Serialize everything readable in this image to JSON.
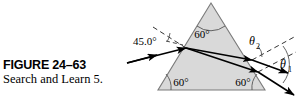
{
  "figure": {
    "number_label": "FIGURE 24–63",
    "caption": "Search and Learn 5.",
    "colors": {
      "prism_fill": "#d9d9d9",
      "prism_stroke": "#6e6e6e",
      "ray_stroke": "#000000",
      "normal_dash": "#333333",
      "arc_stroke": "#555555",
      "background": "#ffffff"
    }
  },
  "diagram": {
    "type": "optics-prism-dispersion",
    "prism": {
      "shape": "equilateral-triangle",
      "apex_angle_label": "60°",
      "bottom_left_angle_label": "60°",
      "bottom_right_angle_label": "60°",
      "vertices": {
        "apex": [
          211,
          3
        ],
        "bottom_left": [
          158,
          90
        ],
        "bottom_right": [
          265,
          90
        ]
      }
    },
    "incident_ray": {
      "angle_label": "45.0°",
      "description": "incoming ray striking left face",
      "start": [
        127,
        63
      ],
      "end": [
        186,
        48
      ]
    },
    "exit_rays": [
      {
        "angle_label": "θ",
        "subscript": "2",
        "description": "upper refracted exit ray"
      },
      {
        "angle_label": "θ",
        "subscript": "1",
        "description": "lower refracted exit ray"
      }
    ]
  }
}
